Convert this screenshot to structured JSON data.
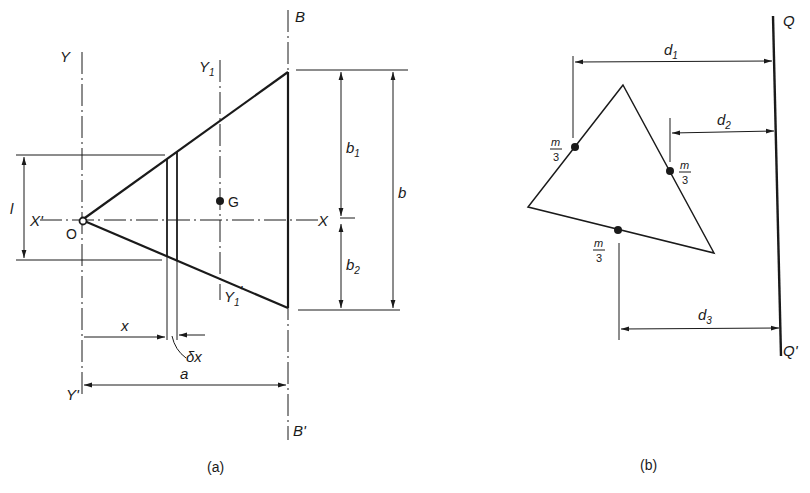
{
  "figure_a": {
    "caption": "(a)",
    "axes": {
      "Y": "Y",
      "Y_prime": "Y'",
      "Y1": "Y",
      "Y1_sub": "1",
      "Y1_prime": "Y",
      "Y1_prime_sub": "1",
      "Y1_prime_mark": "'",
      "X": "X",
      "X_prime": "X'",
      "B": "B",
      "B_prime": "B'"
    },
    "points": {
      "origin": "O",
      "centroid": "G"
    },
    "dimensions": {
      "l": "l",
      "x": "x",
      "dx": "δx",
      "a": "a",
      "b": "b",
      "b1": "b",
      "b1_sub": "1",
      "b2": "b",
      "b2_sub": "2"
    }
  },
  "figure_b": {
    "caption": "(b)",
    "line": {
      "top": "Q",
      "bottom": "Q'"
    },
    "masses": [
      {
        "num": "m",
        "den": "3"
      },
      {
        "num": "m",
        "den": "3"
      },
      {
        "num": "m",
        "den": "3"
      }
    ],
    "distances": {
      "d1": "d",
      "d1_sub": "1",
      "d2": "d",
      "d2_sub": "2",
      "d3": "d",
      "d3_sub": "3"
    }
  },
  "colors": {
    "ink": "#1a1a1a",
    "background": "#ffffff"
  }
}
